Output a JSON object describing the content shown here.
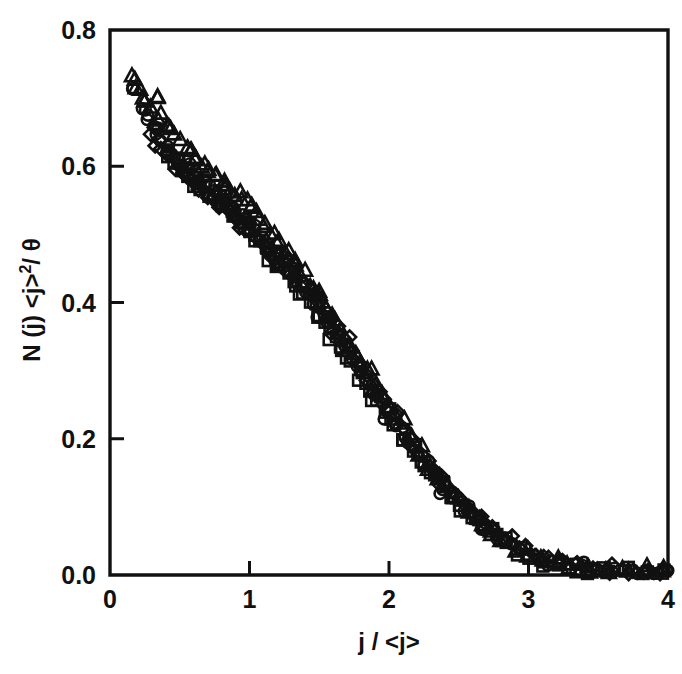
{
  "figure": {
    "kind": "scatter-plot",
    "background": "#ffffff",
    "ink_color": "#111111"
  },
  "axes": {
    "x": {
      "label": "j / <j>",
      "ticks": [
        "0",
        "1",
        "2",
        "3",
        "4"
      ],
      "tick_values": [
        0,
        1,
        2,
        3,
        4
      ],
      "min": 0,
      "max": 4
    },
    "y": {
      "label_main": "N (j) <j>",
      "label_exponent": "2",
      "label_tail": "/ θ",
      "label": "N (j) <j>² / θ",
      "ticks": [
        "0.0",
        "0.2",
        "0.4",
        "0.6",
        "0.8"
      ],
      "tick_values": [
        0.0,
        0.2,
        0.4,
        0.6,
        0.8
      ],
      "min": 0.0,
      "max": 0.8
    }
  },
  "chart_data": {
    "type": "scatter",
    "title": "",
    "xlabel": "j / <j>",
    "ylabel": "N (j) <j>² / θ",
    "xlim": [
      0,
      4
    ],
    "ylim": [
      0.0,
      0.8
    ],
    "grid": false,
    "legend": "none",
    "marker_styles": [
      "open-triangle",
      "open-circle",
      "open-diamond",
      "open-square"
    ],
    "series": [
      {
        "name": "triangles",
        "marker": "open-triangle",
        "x": [
          0.15,
          0.2,
          0.24,
          0.28,
          0.33,
          0.38,
          0.42,
          0.47,
          0.52,
          0.57,
          0.62,
          0.66,
          0.71,
          0.76,
          0.81,
          0.86,
          0.91,
          0.96,
          1.01,
          1.06,
          1.11,
          1.16,
          1.21,
          1.27,
          1.32,
          1.38,
          1.43,
          1.49,
          1.54,
          1.6,
          1.66,
          1.72,
          1.78,
          1.84,
          1.9,
          1.96,
          2.02,
          2.09,
          2.15,
          2.22,
          2.29,
          2.36,
          2.43,
          2.5,
          2.58,
          2.66,
          2.74,
          2.82,
          2.91,
          3.0,
          3.1,
          3.2,
          3.3,
          3.42,
          3.55,
          3.68,
          3.82,
          3.95
        ],
        "y": [
          0.735,
          0.712,
          0.7,
          0.686,
          0.7,
          0.676,
          0.662,
          0.648,
          0.636,
          0.625,
          0.612,
          0.602,
          0.596,
          0.586,
          0.575,
          0.566,
          0.556,
          0.548,
          0.536,
          0.526,
          0.512,
          0.5,
          0.486,
          0.472,
          0.456,
          0.44,
          0.426,
          0.408,
          0.392,
          0.374,
          0.356,
          0.338,
          0.318,
          0.3,
          0.28,
          0.26,
          0.24,
          0.22,
          0.2,
          0.18,
          0.162,
          0.144,
          0.126,
          0.11,
          0.094,
          0.078,
          0.063,
          0.05,
          0.038,
          0.028,
          0.021,
          0.016,
          0.012,
          0.009,
          0.007,
          0.005,
          0.004,
          0.003
        ]
      },
      {
        "name": "circles",
        "marker": "open-circle",
        "x": [
          0.17,
          0.22,
          0.27,
          0.31,
          0.36,
          0.41,
          0.45,
          0.5,
          0.55,
          0.6,
          0.64,
          0.69,
          0.74,
          0.79,
          0.84,
          0.89,
          0.94,
          0.99,
          1.04,
          1.09,
          1.14,
          1.19,
          1.25,
          1.3,
          1.35,
          1.41,
          1.46,
          1.52,
          1.58,
          1.63,
          1.69,
          1.75,
          1.81,
          1.87,
          1.93,
          1.99,
          2.06,
          2.12,
          2.19,
          2.26,
          2.33,
          2.4,
          2.47,
          2.55,
          2.62,
          2.7,
          2.79,
          2.87,
          2.96,
          3.06,
          3.16,
          3.27,
          3.38,
          3.5,
          3.63,
          3.76,
          3.89,
          3.98
        ],
        "y": [
          0.715,
          0.688,
          0.666,
          0.655,
          0.64,
          0.628,
          0.618,
          0.608,
          0.6,
          0.59,
          0.582,
          0.574,
          0.566,
          0.558,
          0.548,
          0.54,
          0.53,
          0.52,
          0.51,
          0.498,
          0.486,
          0.474,
          0.46,
          0.446,
          0.432,
          0.416,
          0.4,
          0.384,
          0.366,
          0.35,
          0.332,
          0.314,
          0.296,
          0.276,
          0.258,
          0.238,
          0.218,
          0.198,
          0.18,
          0.162,
          0.144,
          0.128,
          0.112,
          0.096,
          0.082,
          0.068,
          0.055,
          0.044,
          0.034,
          0.026,
          0.019,
          0.014,
          0.011,
          0.008,
          0.006,
          0.005,
          0.004,
          0.003
        ]
      },
      {
        "name": "diamonds",
        "marker": "open-diamond",
        "x": [
          0.3,
          0.35,
          0.4,
          0.44,
          0.49,
          0.54,
          0.59,
          0.63,
          0.68,
          0.73,
          0.78,
          0.83,
          0.88,
          0.93,
          0.98,
          1.03,
          1.08,
          1.13,
          1.18,
          1.23,
          1.29,
          1.34,
          1.4,
          1.45,
          1.51,
          1.57,
          1.62,
          1.68,
          1.74,
          1.8,
          1.86,
          1.92,
          1.98,
          2.05,
          2.11,
          2.18,
          2.25,
          2.32,
          2.39,
          2.46,
          2.53,
          2.61,
          2.69,
          2.77,
          2.85,
          2.94,
          3.03,
          3.13,
          3.23,
          3.34,
          3.46,
          3.58,
          3.71,
          3.85,
          3.97
        ],
        "y": [
          0.65,
          0.638,
          0.622,
          0.612,
          0.6,
          0.59,
          0.58,
          0.572,
          0.563,
          0.554,
          0.545,
          0.536,
          0.527,
          0.518,
          0.508,
          0.498,
          0.487,
          0.476,
          0.464,
          0.452,
          0.466,
          0.44,
          0.426,
          0.412,
          0.396,
          0.378,
          0.362,
          0.346,
          0.328,
          0.31,
          0.292,
          0.272,
          0.254,
          0.234,
          0.214,
          0.196,
          0.177,
          0.159,
          0.142,
          0.126,
          0.11,
          0.094,
          0.08,
          0.066,
          0.054,
          0.042,
          0.032,
          0.024,
          0.018,
          0.013,
          0.01,
          0.007,
          0.005,
          0.004,
          0.003
        ]
      },
      {
        "name": "squares",
        "marker": "open-square",
        "x": [
          0.42,
          0.47,
          0.52,
          0.57,
          0.61,
          0.66,
          0.71,
          0.76,
          0.81,
          0.86,
          0.91,
          0.96,
          1.01,
          1.06,
          1.12,
          1.17,
          1.22,
          1.28,
          1.33,
          1.39,
          1.44,
          1.5,
          1.56,
          1.61,
          1.67,
          1.73,
          1.79,
          1.85,
          1.91,
          1.97,
          2.04,
          2.1,
          2.17,
          2.24,
          2.31,
          2.38,
          2.45,
          2.52,
          2.6,
          2.68,
          2.76,
          2.84,
          2.93,
          3.02,
          3.12,
          3.22,
          3.33,
          3.44,
          3.57,
          3.7,
          3.84,
          3.96
        ],
        "y": [
          0.618,
          0.606,
          0.596,
          0.586,
          0.578,
          0.57,
          0.561,
          0.552,
          0.543,
          0.534,
          0.524,
          0.514,
          0.504,
          0.493,
          0.481,
          0.469,
          0.456,
          0.442,
          0.428,
          0.412,
          0.397,
          0.381,
          0.364,
          0.348,
          0.331,
          0.313,
          0.295,
          0.277,
          0.258,
          0.239,
          0.22,
          0.202,
          0.184,
          0.166,
          0.149,
          0.132,
          0.116,
          0.101,
          0.086,
          0.072,
          0.059,
          0.048,
          0.038,
          0.029,
          0.022,
          0.016,
          0.012,
          0.009,
          0.007,
          0.005,
          0.004,
          0.003
        ]
      }
    ]
  },
  "geometry": {
    "plot_left": 110,
    "plot_right": 668,
    "plot_top": 30,
    "plot_bottom": 575
  }
}
